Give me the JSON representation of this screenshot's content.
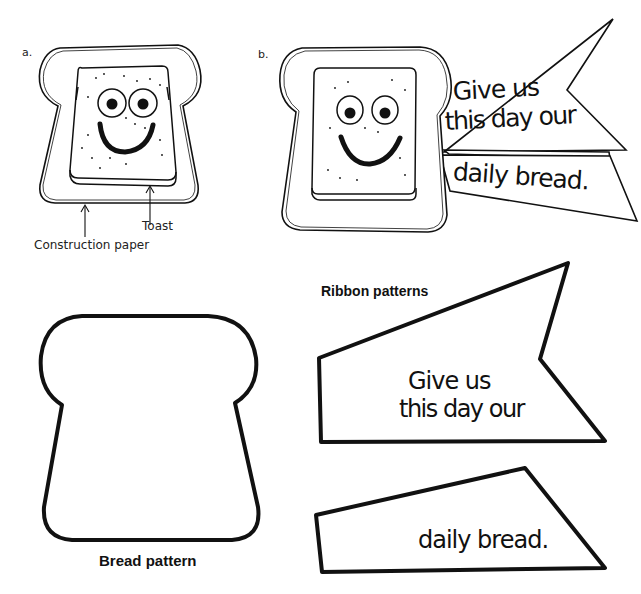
{
  "figure_a": {
    "label": "a.",
    "callouts": {
      "construction_paper": "Construction paper",
      "toast": "Toast"
    }
  },
  "figure_b": {
    "label": "b.",
    "ribbon_top_text_line1": "Give us",
    "ribbon_top_text_line2": "this day our",
    "ribbon_bottom_text": "daily bread."
  },
  "patterns": {
    "ribbon_title": "Ribbon patterns",
    "ribbon_top_line1": "Give us",
    "ribbon_top_line2": "this day our",
    "ribbon_bottom": "daily bread.",
    "bread_title": "Bread pattern"
  },
  "colors": {
    "ink": "#111111",
    "paper": "#ffffff"
  }
}
